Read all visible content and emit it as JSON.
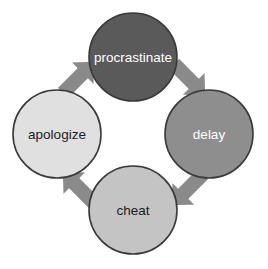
{
  "diagram": {
    "type": "cycle",
    "direction": "clockwise",
    "background_color": "#ffffff",
    "node_stroke_color": "#3a3a3a",
    "arrow_fill_color": "#8a8a8a",
    "arrow_stroke_color": "#ffffff",
    "nodes": [
      {
        "id": "procrastinate",
        "label": "procrastinate",
        "position": "top",
        "cx": 133,
        "cy": 57,
        "r": 44,
        "fill_color": "#5a5a5a",
        "text_color": "#ffffff"
      },
      {
        "id": "delay",
        "label": "delay",
        "position": "right",
        "cx": 209,
        "cy": 134,
        "r": 44,
        "fill_color": "#8e8e8e",
        "text_color": "#ffffff"
      },
      {
        "id": "cheat",
        "label": "cheat",
        "position": "bottom",
        "cx": 133,
        "cy": 210,
        "r": 44,
        "fill_color": "#c4c4c4",
        "text_color": "#1c1c1c"
      },
      {
        "id": "apologize",
        "label": "apologize",
        "position": "left",
        "cx": 57,
        "cy": 134,
        "r": 44,
        "fill_color": "#e0e0e0",
        "text_color": "#1c1c1c"
      }
    ],
    "arrows": [
      {
        "id": "procrastinate-to-delay",
        "from": "procrastinate",
        "to": "delay",
        "direction": "down-right"
      },
      {
        "id": "delay-to-cheat",
        "from": "delay",
        "to": "cheat",
        "direction": "down-left"
      },
      {
        "id": "cheat-to-apologize",
        "from": "cheat",
        "to": "apologize",
        "direction": "up-left"
      },
      {
        "id": "apologize-to-procrastinate",
        "from": "apologize",
        "to": "procrastinate",
        "direction": "up-right"
      }
    ]
  }
}
